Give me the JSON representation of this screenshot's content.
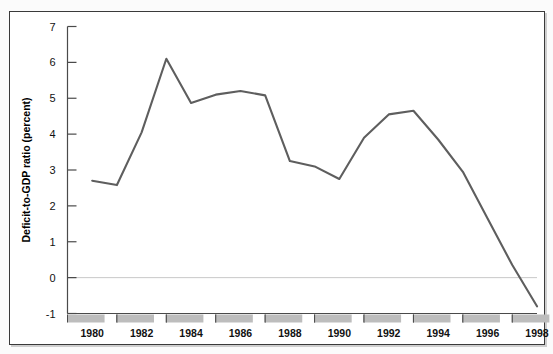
{
  "figure": {
    "background_color": "#ffffff",
    "frame_color": "#3a3a3a",
    "line_color": "#5e5e5e",
    "tickbar_fill": "#bdbdbd",
    "zero_line_color": "#c9c9c9"
  },
  "chart_data": {
    "type": "line",
    "title": "",
    "xlabel": "",
    "ylabel": "Deficit-to-GDP ratio (percent)",
    "ylim": [
      -1,
      7
    ],
    "xlim": [
      1979,
      1998
    ],
    "grid": false,
    "legend": null,
    "yticks": [
      -1,
      0,
      1,
      2,
      3,
      4,
      5,
      6,
      7
    ],
    "ytick_labels": [
      "-1",
      "0",
      "1",
      "2",
      "3",
      "4",
      "5",
      "6",
      "7"
    ],
    "xticks": [
      1980,
      1982,
      1984,
      1986,
      1988,
      1990,
      1992,
      1994,
      1996,
      1998
    ],
    "xtick_labels": [
      "1980",
      "1982",
      "1984",
      "1986",
      "1988",
      "1990",
      "1992",
      "1994",
      "1996",
      "1998"
    ],
    "zero_line": 0,
    "x": [
      1980,
      1981,
      1982,
      1983,
      1984,
      1985,
      1986,
      1987,
      1988,
      1989,
      1990,
      1991,
      1992,
      1993,
      1994,
      1995,
      1996,
      1997,
      1998
    ],
    "values": [
      2.7,
      2.58,
      4.05,
      6.1,
      4.87,
      5.1,
      5.2,
      5.08,
      3.25,
      3.1,
      2.75,
      3.9,
      4.55,
      4.65,
      3.85,
      2.95,
      1.65,
      0.35,
      -0.8
    ],
    "series": [
      {
        "name": "Deficit-to-GDP ratio",
        "values": [
          2.7,
          2.58,
          4.05,
          6.1,
          4.87,
          5.1,
          5.2,
          5.08,
          3.25,
          3.1,
          2.75,
          3.9,
          4.55,
          4.65,
          3.85,
          2.95,
          1.65,
          0.35,
          -0.8
        ]
      }
    ]
  }
}
